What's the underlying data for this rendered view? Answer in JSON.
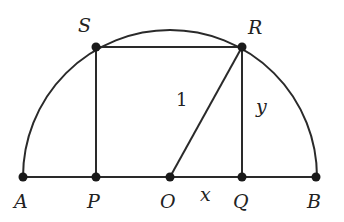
{
  "diagram": {
    "title": "",
    "stroke_color": "#2a2a2a",
    "points": [
      {
        "id": "A",
        "label": "A",
        "x": 23,
        "y": 177,
        "lx": 14,
        "ly": 208
      },
      {
        "id": "P",
        "label": "P",
        "x": 96,
        "y": 177,
        "lx": 87,
        "ly": 208
      },
      {
        "id": "O",
        "label": "O",
        "x": 170,
        "y": 177,
        "lx": 160,
        "ly": 208
      },
      {
        "id": "Q",
        "label": "Q",
        "x": 242,
        "y": 177,
        "lx": 233,
        "ly": 208
      },
      {
        "id": "B",
        "label": "B",
        "x": 316,
        "y": 177,
        "lx": 307,
        "ly": 208
      },
      {
        "id": "S",
        "label": "S",
        "x": 96,
        "y": 47,
        "lx": 78,
        "ly": 32
      },
      {
        "id": "R",
        "label": "R",
        "x": 242,
        "y": 47,
        "lx": 248,
        "ly": 34
      }
    ],
    "segment_labels": [
      {
        "id": "radius-label",
        "text": "1",
        "x": 176,
        "y": 106,
        "italic": false
      },
      {
        "id": "y-label",
        "text": "y",
        "x": 256,
        "y": 113,
        "italic": true
      },
      {
        "id": "x-label",
        "text": "x",
        "x": 200,
        "y": 201,
        "italic": true
      }
    ],
    "semicircle": {
      "center": "O",
      "radius": 147
    },
    "rectangle": [
      "P",
      "Q",
      "R",
      "S"
    ],
    "segments": [
      [
        "A",
        "B"
      ],
      [
        "O",
        "R"
      ],
      [
        "S",
        "P"
      ],
      [
        "R",
        "Q"
      ],
      [
        "S",
        "R"
      ]
    ]
  }
}
